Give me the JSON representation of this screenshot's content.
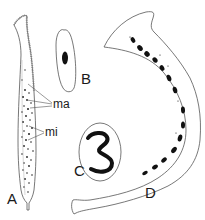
{
  "figure": {
    "panels": [
      {
        "id": "A",
        "label": "A",
        "description": "elongated ciliated cell with many small nuclei"
      },
      {
        "id": "B",
        "label": "B",
        "description": "oval cell with single dark nucleus"
      },
      {
        "id": "C",
        "label": "C",
        "description": "oval cell with large curved macronucleus"
      },
      {
        "id": "D",
        "label": "D",
        "description": "long curved cell with beaded chain of nuclei"
      }
    ],
    "annotations": [
      {
        "label": "ma",
        "target": "A"
      },
      {
        "label": "mi",
        "target": "A"
      }
    ],
    "colors": {
      "ink": "#111111",
      "outline": "#555555",
      "background": "#ffffff"
    }
  }
}
